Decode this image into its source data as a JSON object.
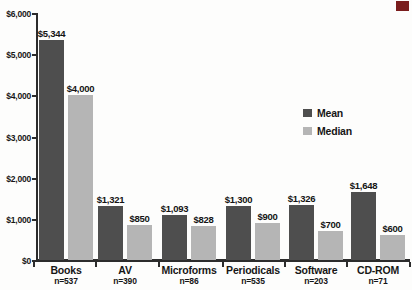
{
  "page": {
    "background": "#fdfdfc",
    "corner_decoration_color": "#7a1d1d"
  },
  "chart_data": {
    "type": "bar",
    "title": "",
    "xlabel": "",
    "ylabel": "",
    "categories": [
      "Books",
      "AV",
      "Microforms",
      "Periodicals",
      "Software",
      "CD-ROM"
    ],
    "sample_sizes": [
      "n=537",
      "n=390",
      "n=86",
      "n=535",
      "n=203",
      "n=71"
    ],
    "series": [
      {
        "name": "Mean",
        "color": "#4e4e4e",
        "values": [
          5344,
          1321,
          1093,
          1300,
          1326,
          1648
        ],
        "value_labels": [
          "$5,344",
          "$1,321",
          "$1,093",
          "$1,300",
          "$1,326",
          "$1,648"
        ]
      },
      {
        "name": "Median",
        "color": "#b5b5b5",
        "values": [
          4000,
          850,
          828,
          900,
          700,
          600
        ],
        "value_labels": [
          "$4,000",
          "$850",
          "$828",
          "$900",
          "$700",
          "$600"
        ]
      }
    ],
    "y_axis": {
      "min": 0,
      "max": 6000,
      "tick_interval": 1000,
      "tick_labels": [
        "$6,000",
        "$5,000",
        "$4,000",
        "$3,000",
        "$2,000",
        "$1,000",
        "$0"
      ]
    },
    "grid": "off",
    "legend_position": "middle-right",
    "legend_entries": [
      "Mean",
      "Median"
    ]
  }
}
